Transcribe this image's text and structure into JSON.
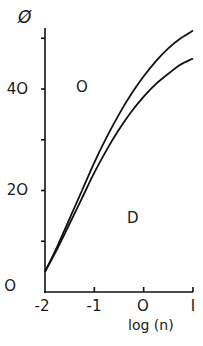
{
  "chart_data": {
    "type": "line",
    "title": "",
    "xlabel": "log (n)",
    "ylabel": "Ø",
    "xlim": [
      -2,
      1
    ],
    "ylim": [
      0,
      52
    ],
    "x_ticks": [
      -2,
      -1,
      0,
      1
    ],
    "x_tick_labels": [
      "-2",
      "-1",
      "O",
      "I"
    ],
    "y_ticks": [
      0,
      20,
      40
    ],
    "y_tick_labels": [
      "O",
      "2O",
      "4O"
    ],
    "y_minor_ticks": [
      10,
      30,
      50
    ],
    "grid": false,
    "legend": null,
    "annotations": [
      {
        "text": "O",
        "x": -1.22,
        "y": 35
      },
      {
        "text": "D",
        "x": -0.2,
        "y": 14.5
      }
    ],
    "series": [
      {
        "name": "upper curve",
        "x": [
          -2.0,
          -1.75,
          -1.5,
          -1.25,
          -1.0,
          -0.75,
          -0.5,
          -0.25,
          0.0,
          0.25,
          0.5,
          0.75,
          1.0
        ],
        "values": [
          4,
          9,
          14.5,
          20,
          25.5,
          30.5,
          35,
          39,
          42.5,
          45.5,
          48,
          50,
          51.5
        ]
      },
      {
        "name": "lower curve",
        "x": [
          -2.0,
          -1.75,
          -1.5,
          -1.25,
          -1.0,
          -0.75,
          -0.5,
          -0.25,
          0.0,
          0.25,
          0.5,
          0.75,
          1.0
        ],
        "values": [
          4,
          8.5,
          13.5,
          18.5,
          23.5,
          28,
          32,
          35.5,
          38.5,
          41,
          43,
          44.8,
          46
        ]
      }
    ]
  }
}
